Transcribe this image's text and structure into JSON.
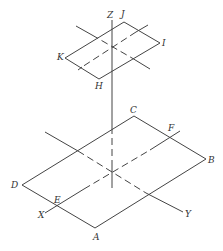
{
  "diagram": {
    "title": "",
    "type": "isometric projection of two parallel parallelograms on a vertical axis",
    "top_plane": {
      "vertices": [
        {
          "label": "J",
          "x": 124,
          "y": 22
        },
        {
          "label": "I",
          "x": 160,
          "y": 43
        },
        {
          "label": "H",
          "x": 99,
          "y": 79
        },
        {
          "label": "K",
          "x": 65,
          "y": 58
        }
      ]
    },
    "bottom_plane": {
      "vertices": [
        {
          "label": "C",
          "x": 134,
          "y": 116
        },
        {
          "label": "B",
          "x": 206,
          "y": 159
        },
        {
          "label": "A",
          "x": 95,
          "y": 228
        },
        {
          "label": "D",
          "x": 22,
          "y": 185
        }
      ],
      "points": [
        {
          "label": "E",
          "x": 56,
          "y": 207
        },
        {
          "label": "F",
          "x": 171,
          "y": 137
        }
      ]
    },
    "axes": [
      {
        "label": "X"
      },
      {
        "label": "Y"
      },
      {
        "label": "Z"
      }
    ],
    "labels": {
      "Z": "Z",
      "J": "J",
      "I": "I",
      "K": "K",
      "H": "H",
      "C": "C",
      "F": "F",
      "B": "B",
      "D": "D",
      "E": "E",
      "X": "X",
      "Y": "Y",
      "A": "A"
    }
  }
}
